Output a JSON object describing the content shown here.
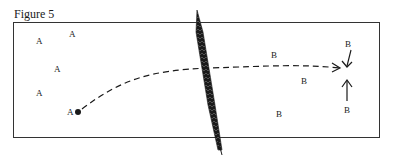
{
  "figure": {
    "caption": "Figure 5",
    "group_a": {
      "label": "A",
      "points": [
        {
          "x": 36,
          "y": 37
        },
        {
          "x": 69,
          "y": 30
        },
        {
          "x": 54,
          "y": 65
        },
        {
          "x": 36,
          "y": 89
        },
        {
          "x": 67,
          "y": 108
        }
      ]
    },
    "group_b": {
      "label": "B",
      "points": [
        {
          "x": 271,
          "y": 51
        },
        {
          "x": 301,
          "y": 77
        },
        {
          "x": 276,
          "y": 110
        },
        {
          "x": 345,
          "y": 40
        },
        {
          "x": 344,
          "y": 106
        }
      ]
    },
    "colors": {
      "ink": "#1a1a1a",
      "frame": "#333333",
      "background": "#ffffff"
    }
  }
}
